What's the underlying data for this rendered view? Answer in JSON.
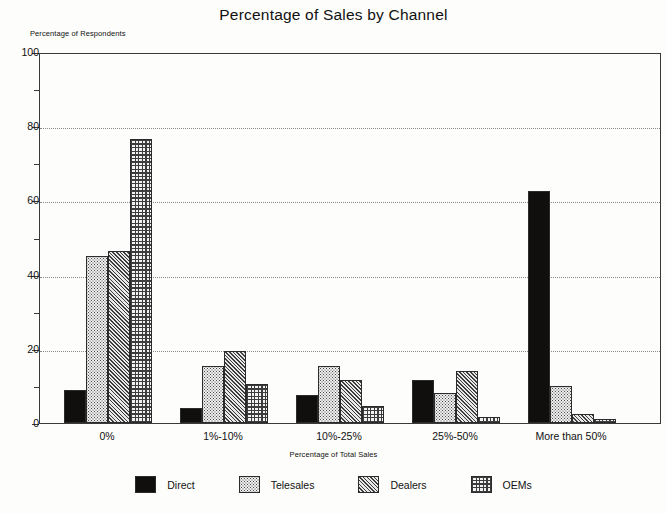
{
  "chart_data": {
    "type": "bar",
    "title": "Percentage of Sales by Channel",
    "xlabel": "Percentage of Total Sales",
    "ylabel": "Percentage of Respondents",
    "categories": [
      "0%",
      "1%-10%",
      "10%-25%",
      "25%-50%",
      "More than 50%"
    ],
    "series": [
      {
        "name": "Direct",
        "pattern": "solid-black",
        "values": [
          9,
          4,
          7.5,
          11.5,
          62.5
        ]
      },
      {
        "name": "Telesales",
        "pattern": "dotted-stipple",
        "values": [
          45,
          15.5,
          15.5,
          8,
          10
        ]
      },
      {
        "name": "Dealers",
        "pattern": "diagonal-hatch",
        "values": [
          46.5,
          19.5,
          11.5,
          14,
          2.5
        ]
      },
      {
        "name": "OEMs",
        "pattern": "checkerboard",
        "values": [
          76.5,
          10.5,
          4.5,
          1.5,
          1
        ]
      }
    ],
    "ylim": [
      0,
      100
    ],
    "yticks_major": [
      0,
      20,
      40,
      60,
      80,
      100
    ],
    "yticks_minor": [
      10,
      30,
      50,
      70,
      90
    ],
    "ytick_labels": [
      "0",
      "20",
      "40",
      "60",
      "80",
      "100"
    ],
    "grid": "horizontal-dotted-at-major",
    "legend_position": "bottom-center",
    "colors": {
      "axis": "#3a3a3a",
      "grid": "#8a8a8a",
      "direct": "#100f0e",
      "telesales": "#efefef",
      "dealers": "#e8e8e8",
      "oems": "#f2f2f2",
      "background": "#fdfdfb",
      "text": "#111111"
    }
  }
}
